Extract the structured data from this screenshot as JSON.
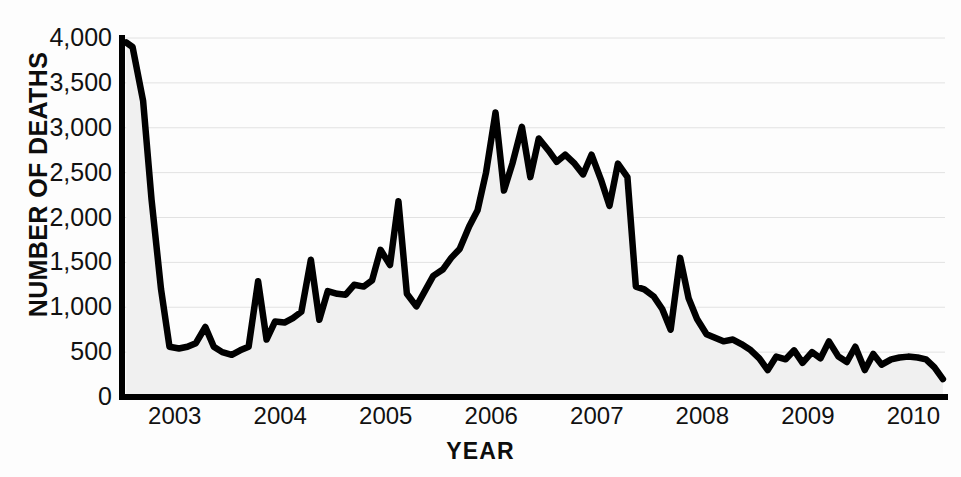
{
  "chart_data": {
    "type": "area",
    "title": "",
    "subtitle": "",
    "xlabel": "YEAR",
    "ylabel": "NUMBER OF DEATHS",
    "xlim": [
      2002.5,
      2010.3
    ],
    "ylim": [
      0,
      4000
    ],
    "grid": true,
    "legend": null,
    "y_ticks": [
      0,
      500,
      1000,
      1500,
      2000,
      2500,
      3000,
      3500,
      4000
    ],
    "y_tick_labels": [
      "0",
      "500",
      "1,000",
      "1,500",
      "2,000",
      "2,500",
      "3,000",
      "3,500",
      "4,000"
    ],
    "x_ticks": [
      2003,
      2004,
      2005,
      2006,
      2007,
      2008,
      2009,
      2010
    ],
    "x_tick_labels": [
      "2003",
      "2004",
      "2005",
      "2006",
      "2007",
      "2008",
      "2009",
      "2010"
    ],
    "line_color": "#000000",
    "fill_color": "#f0f0f0",
    "grid_color": "#e2e2e2",
    "axis_color": "#000000",
    "series": [
      {
        "name": "Number of deaths",
        "x": [
          2002.54,
          2002.6,
          2002.7,
          2002.78,
          2002.87,
          2002.95,
          2003.04,
          2003.12,
          2003.2,
          2003.29,
          2003.37,
          2003.45,
          2003.54,
          2003.62,
          2003.7,
          2003.79,
          2003.87,
          2003.95,
          2004.04,
          2004.12,
          2004.2,
          2004.29,
          2004.37,
          2004.45,
          2004.54,
          2004.62,
          2004.7,
          2004.79,
          2004.87,
          2004.95,
          2005.04,
          2005.12,
          2005.2,
          2005.29,
          2005.37,
          2005.45,
          2005.54,
          2005.62,
          2005.7,
          2005.79,
          2005.87,
          2005.95,
          2006.04,
          2006.12,
          2006.2,
          2006.29,
          2006.37,
          2006.45,
          2006.54,
          2006.62,
          2006.7,
          2006.79,
          2006.87,
          2006.95,
          2007.04,
          2007.12,
          2007.2,
          2007.29,
          2007.37,
          2007.45,
          2007.54,
          2007.62,
          2007.7,
          2007.79,
          2007.87,
          2007.95,
          2008.04,
          2008.12,
          2008.2,
          2008.29,
          2008.37,
          2008.45,
          2008.54,
          2008.62,
          2008.7,
          2008.79,
          2008.87,
          2008.95,
          2009.04,
          2009.12,
          2009.2,
          2009.29,
          2009.37,
          2009.45,
          2009.54,
          2009.62,
          2009.7,
          2009.79,
          2009.87,
          2009.95,
          2010.04,
          2010.12,
          2010.2,
          2010.28
        ],
        "values": [
          3950,
          3900,
          3300,
          2200,
          1200,
          560,
          540,
          560,
          600,
          780,
          560,
          500,
          470,
          520,
          560,
          1290,
          640,
          840,
          830,
          880,
          950,
          1530,
          860,
          1180,
          1150,
          1140,
          1250,
          1230,
          1300,
          1640,
          1470,
          2180,
          1150,
          1010,
          1180,
          1350,
          1420,
          1550,
          1650,
          1900,
          2080,
          2500,
          3170,
          2300,
          2600,
          3010,
          2450,
          2880,
          2750,
          2620,
          2700,
          2600,
          2480,
          2700,
          2420,
          2130,
          2600,
          2450,
          1230,
          1200,
          1120,
          980,
          750,
          1550,
          1100,
          870,
          700,
          660,
          620,
          640,
          590,
          530,
          430,
          300,
          450,
          420,
          520,
          380,
          500,
          430,
          620,
          450,
          390,
          560,
          300,
          480,
          360,
          420,
          440,
          450,
          440,
          420,
          330,
          200
        ]
      }
    ]
  }
}
